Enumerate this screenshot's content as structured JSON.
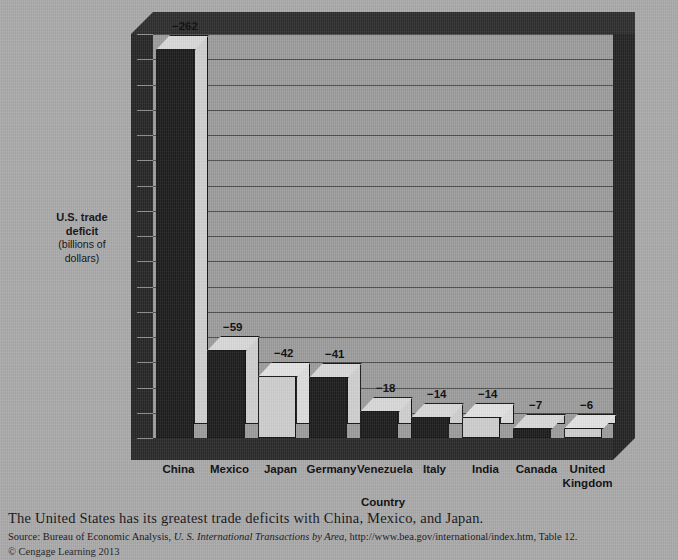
{
  "figure": {
    "y_axis_title_strong": "U.S. trade\ndeficit",
    "y_axis_title_line1": "U.S. trade",
    "y_axis_title_line2": "deficit",
    "y_axis_unit_line1": "(billions of",
    "y_axis_unit_line2": "dollars)",
    "x_axis_title": "Country"
  },
  "chart_data": {
    "type": "bar",
    "title": "",
    "xlabel": "Country",
    "ylabel": "U.S. trade deficit (billions of dollars)",
    "categories": [
      "China",
      "Mexico",
      "Japan",
      "Germany",
      "Venezuela",
      "Italy",
      "India",
      "Canada",
      "United Kingdom"
    ],
    "values": [
      -262,
      -59,
      -42,
      -41,
      -18,
      -14,
      -14,
      -7,
      -6
    ],
    "value_labels": [
      "−262",
      "−59",
      "−42",
      "−41",
      "−18",
      "−14",
      "−14",
      "−7",
      "−6"
    ],
    "bar_styles": [
      "dark",
      "dark",
      "light",
      "dark",
      "dark",
      "dark",
      "light",
      "dark",
      "light"
    ],
    "ylim": [
      -272,
      0
    ],
    "grid": true,
    "gridline_count": 17,
    "legend": "none",
    "three_d": true,
    "category_label_lines": [
      [
        "China"
      ],
      [
        "Mexico"
      ],
      [
        "Japan"
      ],
      [
        "Germany"
      ],
      [
        "Venezuela"
      ],
      [
        "Italy"
      ],
      [
        "India"
      ],
      [
        "Canada"
      ],
      [
        "United",
        "Kingdom"
      ]
    ]
  },
  "caption": {
    "main": "The United States has its greatest trade deficits with China, Mexico, and Japan.",
    "source_prefix": "Source: Bureau of Economic Analysis, ",
    "source_italic_lead": "U. S. ",
    "source_italic_title": "International Transactions by Area",
    "source_suffix": ", http://www.bea.gov/international/index.htm, Table 12.",
    "copyright": "© Cengage Learning 2013"
  },
  "colors": {
    "page_background": "#a9a9a9",
    "plot_background": "#9c9c9c",
    "wall_dark": "#2b2b2b",
    "gridline": "#4c4c4c",
    "bar_dark_front": "#1d1d1d",
    "bar_light_front": "#cdcdcd",
    "text": "#0c0c0c"
  }
}
